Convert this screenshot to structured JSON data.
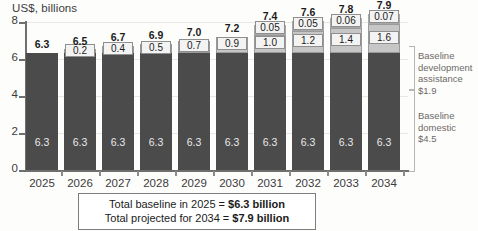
{
  "chart_data": {
    "type": "bar",
    "stacked": true,
    "title": "US$, billions",
    "xlabel": "",
    "ylabel": "US$, billions",
    "ylim": [
      0,
      8
    ],
    "yticks": [
      0,
      2,
      4,
      6,
      8
    ],
    "grid": true,
    "legend_position": "right",
    "categories": [
      "2025",
      "2026",
      "2027",
      "2028",
      "2029",
      "2030",
      "2031",
      "2032",
      "2033",
      "2034"
    ],
    "series": [
      {
        "name": "Baseline domestic + development assistance",
        "values": [
          6.3,
          6.3,
          6.3,
          6.3,
          6.3,
          6.3,
          6.3,
          6.3,
          6.3,
          6.3
        ]
      },
      {
        "name": "Additional funding",
        "values": [
          0,
          0.2,
          0.4,
          0.5,
          0.7,
          0.9,
          1.0,
          1.2,
          1.4,
          1.6
        ]
      },
      {
        "name": "Third segment",
        "values": [
          0,
          0,
          0,
          0,
          0,
          0,
          0.05,
          0.05,
          0.06,
          0.07
        ]
      }
    ],
    "base_labels": [
      "6.3",
      "6.3",
      "6.3",
      "6.3",
      "6.3",
      "6.3",
      "6.3",
      "6.3",
      "6.3",
      "6.3"
    ],
    "mid_labels": [
      "",
      "0.2",
      "0.4",
      "0.5",
      "0.7",
      "0.9",
      "1.0",
      "1.2",
      "1.4",
      "1.6"
    ],
    "top_labels": [
      "",
      "",
      "",
      "",
      "",
      "",
      "0.05",
      "0.05",
      "0.06",
      "0.07"
    ],
    "totals": [
      "6.3",
      "6.5",
      "6.7",
      "6.9",
      "7.0",
      "7.2",
      "7.4",
      "7.6",
      "7.8",
      "7.9"
    ],
    "annotations": [
      "Baseline development assistance $1.9",
      "Baseline domestic $4.5",
      "Total baseline in 2025 = $6.3 billion",
      "Total projected for 2034 = $7.9 billion"
    ]
  },
  "legend": {
    "dev_line1": "Baseline",
    "dev_line2": "development",
    "dev_line3": "assistance",
    "dev_value": "$1.9",
    "dom_line1": "Baseline",
    "dom_line2": "domestic",
    "dom_value": "$4.5"
  },
  "caption": {
    "line1_prefix": "Total baseline in 2025 = ",
    "line1_value": "$6.3 billion",
    "line2_prefix": "Total projected for 2034 = ",
    "line2_value": "$7.9 billion"
  },
  "colors": {
    "base": "#4b4b4b",
    "mid": "#c6c6c6",
    "top": "#ebebeb",
    "axis": "#6f6f6f",
    "grid": "#e9e7e4",
    "legend_text": "#6d6a66"
  }
}
